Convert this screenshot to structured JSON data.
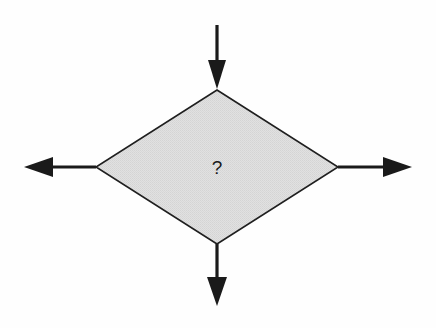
{
  "diagram": {
    "type": "flowchart-decision",
    "background_color": "#fefefe",
    "decision": {
      "shape": "diamond",
      "label": "?",
      "fill_color": "#dedede",
      "stroke_color": "#1a1a1a",
      "center_x": 217,
      "center_y": 167,
      "half_width": 121,
      "half_height": 77
    },
    "connectors": [
      {
        "id": "inbound-top",
        "direction": "down",
        "role": "input",
        "color": "#1a1a1a",
        "from_x": 217,
        "from_y": 25,
        "to_x": 217,
        "to_y": 89
      },
      {
        "id": "outbound-left",
        "direction": "left",
        "role": "output",
        "color": "#1a1a1a",
        "from_x": 96,
        "from_y": 167,
        "to_x": 24,
        "to_y": 167
      },
      {
        "id": "outbound-right",
        "direction": "right",
        "role": "output",
        "color": "#1a1a1a",
        "from_x": 338,
        "from_y": 167,
        "to_x": 412,
        "to_y": 167
      },
      {
        "id": "outbound-bottom",
        "direction": "down",
        "role": "output",
        "color": "#1a1a1a",
        "from_x": 217,
        "from_y": 244,
        "to_x": 217,
        "to_y": 306
      }
    ]
  }
}
